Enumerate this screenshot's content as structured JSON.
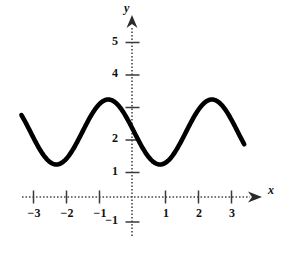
{
  "chart_data": {
    "type": "line",
    "title": "",
    "xlabel": "x",
    "ylabel": "y",
    "xlim": [
      -3.6,
      3.6
    ],
    "ylim": [
      -1.6,
      5.8
    ],
    "grid": false,
    "legend": null,
    "axis_style": "dotted-with-arrowheads",
    "curve": {
      "name": "y = 2 + cos(2x)",
      "domain": [
        -3.35,
        3.4
      ],
      "amplitude": 1,
      "midline": 2,
      "period": 3.1416,
      "y_intercept": 2,
      "maxima": [
        {
          "x": -0.72,
          "y": 3
        },
        {
          "x": 2.28,
          "y": 3
        }
      ],
      "minima": [
        {
          "x": -2.0,
          "y": 1
        },
        {
          "x": 1.0,
          "y": 1
        }
      ],
      "endpoints": [
        {
          "x": -3.35,
          "y": 2.75
        },
        {
          "x": 3.4,
          "y": 1.18
        }
      ]
    },
    "x_ticks": [
      {
        "value": -3,
        "label": "−3"
      },
      {
        "value": -2,
        "label": "−2"
      },
      {
        "value": -1,
        "label": "−1"
      },
      {
        "value": 0,
        "label": ""
      },
      {
        "value": 1,
        "label": "1"
      },
      {
        "value": 2,
        "label": "2"
      },
      {
        "value": 3,
        "label": "3"
      }
    ],
    "y_ticks": [
      {
        "value": 5,
        "label": "5"
      },
      {
        "value": 4,
        "label": "4"
      },
      {
        "value": 3,
        "label": ""
      },
      {
        "value": 2,
        "label": "2"
      },
      {
        "value": 1,
        "label": "1"
      },
      {
        "value": -1,
        "label": "−1"
      }
    ],
    "colors": {
      "curve": "#000000",
      "axis": "#4a4a4a",
      "text": "#111111",
      "background": "#ffffff"
    }
  }
}
